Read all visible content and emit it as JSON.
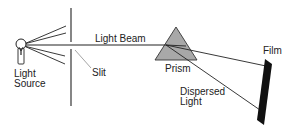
{
  "diagram": {
    "labels": {
      "light_source_line1": "Light",
      "light_source_line2": "Source",
      "slit": "Slit",
      "light_beam": "Light Beam",
      "prism": "Prism",
      "dispersed_line1": "Dispersed",
      "dispersed_line2": "Light",
      "film": "Film"
    },
    "colors": {
      "line": "#222222",
      "prism_fill": "#a8a8a8",
      "film": "#111111",
      "background": "#ffffff"
    }
  }
}
